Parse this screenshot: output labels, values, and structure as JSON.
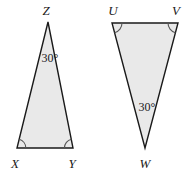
{
  "figure": {
    "background_color": "#ffffff",
    "fill_color": "#e9e9e9",
    "stroke_color": "#1a1a1a",
    "stroke_width": 1.4,
    "arc_stroke_color": "#555555"
  },
  "triangles": [
    {
      "name": "triangle-xyz",
      "vertices": [
        {
          "label": "Z",
          "x": 48,
          "y": 22,
          "label_x": 46,
          "label_y": 15
        },
        {
          "label": "X",
          "x": 17,
          "y": 148,
          "label_x": 15,
          "label_y": 168
        },
        {
          "label": "Y",
          "x": 73,
          "y": 148,
          "label_x": 72,
          "label_y": 168
        }
      ],
      "polygon_points": "48,22 73,148 17,148",
      "angle_marks": [
        {
          "at": "Z",
          "type": "none"
        },
        {
          "at": "X",
          "type": "arc",
          "path": "M 25.8,148 A 9,9 0 0 0 19.2,139.3"
        },
        {
          "at": "Y",
          "type": "arc",
          "path": "M 71.5,139.2 A 9,9 0 0 0 64.4,148"
        }
      ],
      "angle_label": {
        "text": "30°",
        "x": 50,
        "y": 62
      }
    },
    {
      "name": "triangle-uvw",
      "vertices": [
        {
          "label": "U",
          "x": 112,
          "y": 23,
          "label_x": 113,
          "label_y": 15
        },
        {
          "label": "V",
          "x": 178,
          "y": 23,
          "label_x": 176,
          "label_y": 15
        },
        {
          "label": "W",
          "x": 145,
          "y": 148,
          "label_x": 145,
          "label_y": 168
        }
      ],
      "polygon_points": "112,23 178,23 145,148",
      "angle_marks": [
        {
          "at": "U",
          "type": "arc",
          "path": "M 122,23 A 10,10 0 0 1 114.6,32.7"
        },
        {
          "at": "V",
          "type": "arc",
          "path": "M 175.4,32.7 A 10,10 0 0 1 168,23"
        },
        {
          "at": "W",
          "type": "none"
        }
      ],
      "angle_label": {
        "text": "30°",
        "x": 147,
        "y": 111
      }
    }
  ]
}
